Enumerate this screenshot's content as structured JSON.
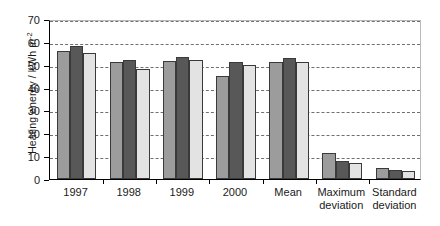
{
  "chart_data": {
    "type": "bar",
    "title": "",
    "xlabel": "",
    "ylabel_text": "Heating energy / kWh m",
    "ylabel_exponent": "-2",
    "ylim": [
      0,
      70
    ],
    "ytick_step": 10,
    "yticks": [
      0,
      10,
      20,
      30,
      40,
      50,
      60,
      70
    ],
    "ytick_labels": [
      "0",
      "10",
      "20",
      "30",
      "40",
      "50",
      "60",
      "70"
    ],
    "grid": "horizontal-dashed",
    "legend": "none",
    "categories": [
      "1997",
      "1998",
      "1999",
      "2000",
      "Mean",
      "Maximum\ndeviation",
      "Standard\ndeviation"
    ],
    "series": [
      {
        "name": "series-1",
        "color": "#9c9c9c",
        "values": [
          56.2,
          51.3,
          51.8,
          45.0,
          51.2,
          11.5,
          5.0
        ]
      },
      {
        "name": "series-2",
        "color": "#585858",
        "values": [
          58.0,
          52.0,
          53.4,
          51.2,
          53.0,
          8.0,
          4.0
        ]
      },
      {
        "name": "series-3",
        "color": "#e3e3e3",
        "values": [
          55.3,
          48.3,
          51.9,
          50.0,
          51.0,
          7.0,
          3.3
        ]
      }
    ]
  },
  "style": {
    "bar_border_color": "#3a3a3a",
    "gridline_color": "#6f6f6f",
    "axis_color": "#000000",
    "frame_color": "#b9b9b9",
    "background": "#ffffff"
  }
}
